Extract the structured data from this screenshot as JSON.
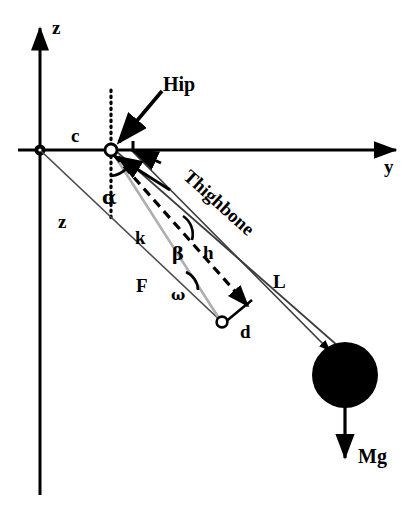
{
  "figure": {
    "kind": "biomechanics-free-body-diagram",
    "background_color": "#ffffff",
    "stroke_color": "#000000",
    "gray_stroke_color": "#8c8c8c"
  },
  "axes": {
    "vertical": {
      "name": "z-axis",
      "label": "z",
      "label_x": 52,
      "label_y": 18,
      "x": 40,
      "y_top": 25,
      "y_bottom": 495
    },
    "horizontal": {
      "name": "y-axis",
      "label": "y",
      "label_x": 384,
      "label_y": 157,
      "y": 150,
      "x_left": 18,
      "x_right": 400
    },
    "origin": {
      "x": 40,
      "y": 150,
      "marker": "open-dot"
    }
  },
  "points": {
    "hip": {
      "label": "Hip",
      "x": 111,
      "y": 150,
      "marker": "open-circle",
      "label_x": 163,
      "label_y": 74
    },
    "muscle_insertion": {
      "x": 222,
      "y": 322,
      "marker": "open-circle"
    },
    "mass_center": {
      "x": 345,
      "y": 375,
      "radius": 33,
      "marker": "filled-circle"
    }
  },
  "labels": {
    "c": {
      "text": "c",
      "x": 71,
      "y": 126
    },
    "z_segment": {
      "text": "z",
      "x": 58,
      "y": 212
    },
    "k": {
      "text": "k",
      "x": 135,
      "y": 228
    },
    "F": {
      "text": "F",
      "x": 136,
      "y": 276
    },
    "h": {
      "text": "h",
      "x": 203,
      "y": 243
    },
    "L": {
      "text": "L",
      "x": 273,
      "y": 272
    },
    "d": {
      "text": "d",
      "x": 240,
      "y": 322
    },
    "alpha": {
      "text": "α",
      "x": 102,
      "y": 188
    },
    "beta": {
      "text": "β",
      "x": 172,
      "y": 245
    },
    "omega": {
      "text": "ω",
      "x": 171,
      "y": 288
    },
    "thighbone": {
      "text": "Thighbone",
      "x": 193,
      "y": 166,
      "rotation_deg": 42
    },
    "Mg": {
      "text": "Mg",
      "x": 358,
      "y": 459
    }
  },
  "segments": [
    {
      "name": "z-line-origin-to-insertion",
      "from": [
        40,
        150
      ],
      "to": [
        225,
        325
      ],
      "style": "thin-solid"
    },
    {
      "name": "k-line-hip-to-insertion",
      "from": [
        111,
        150
      ],
      "to": [
        221,
        321
      ],
      "style": "gray-solid"
    },
    {
      "name": "h-line-hip-dashed",
      "from": [
        113,
        153
      ],
      "to": [
        246,
        305
      ],
      "style": "dashed"
    },
    {
      "name": "L-line-hip-to-mass",
      "from": [
        116,
        152
      ],
      "to": [
        336,
        344
      ],
      "style": "thin-solid"
    },
    {
      "name": "thighbone-line",
      "from": [
        131,
        152
      ],
      "to": [
        327,
        349
      ],
      "style": "thin-solid"
    },
    {
      "name": "d-connector",
      "from": [
        222,
        322
      ],
      "to": [
        251,
        301
      ],
      "style": "solid"
    },
    {
      "name": "Mg-force-arrow",
      "from": [
        345,
        408
      ],
      "to": [
        345,
        462
      ],
      "style": "arrow-down"
    },
    {
      "name": "hip-dotted-vertical",
      "from": [
        111,
        90
      ],
      "to": [
        111,
        218
      ],
      "style": "dotted"
    },
    {
      "name": "hip-callout-arrow",
      "from": [
        160,
        92
      ],
      "to": [
        117,
        144
      ],
      "style": "arrow"
    },
    {
      "name": "alpha-indicator-arrow",
      "from": [
        168,
        188
      ],
      "to": [
        117,
        156
      ],
      "style": "arrow"
    },
    {
      "name": "thighbone-tick-arrow",
      "from": [
        160,
        160
      ],
      "to": [
        132,
        150
      ],
      "style": "arrow"
    }
  ],
  "angle_arcs": [
    {
      "name": "alpha-arc",
      "at": [
        111,
        150
      ],
      "symbol": "α"
    },
    {
      "name": "beta-arc",
      "at": [
        196,
        230
      ],
      "symbol": "β"
    },
    {
      "name": "omega-arc",
      "at": [
        196,
        283
      ],
      "symbol": "ω"
    }
  ]
}
